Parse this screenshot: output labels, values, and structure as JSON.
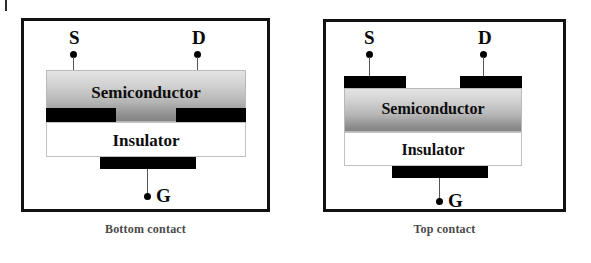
{
  "figure": {
    "page_background": "#ffffff",
    "panels": [
      {
        "id": "bottom-contact",
        "caption": "Bottom contact",
        "layers": [
          {
            "name": "Semiconductor",
            "label": "Semiconductor",
            "fill": "gray-gradient"
          },
          {
            "name": "Insulator",
            "label": "Insulator",
            "fill": "#ffffff"
          }
        ],
        "electrodes": [
          {
            "name": "source",
            "label": "S",
            "position": "bottom-of-semiconductor-left",
            "color": "#000000"
          },
          {
            "name": "drain",
            "label": "D",
            "position": "bottom-of-semiconductor-right",
            "color": "#000000"
          },
          {
            "name": "gate",
            "label": "G",
            "position": "below-insulator",
            "color": "#000000"
          }
        ],
        "border_color": "#121212"
      },
      {
        "id": "top-contact",
        "caption": "Top contact",
        "layers": [
          {
            "name": "Semiconductor",
            "label": "Semiconductor",
            "fill": "gray-gradient"
          },
          {
            "name": "Insulator",
            "label": "Insulator",
            "fill": "#ffffff"
          }
        ],
        "electrodes": [
          {
            "name": "source",
            "label": "S",
            "position": "top-of-semiconductor-left",
            "color": "#000000"
          },
          {
            "name": "drain",
            "label": "D",
            "position": "top-of-semiconductor-right",
            "color": "#000000"
          },
          {
            "name": "gate",
            "label": "G",
            "position": "below-insulator",
            "color": "#000000"
          }
        ],
        "border_color": "#121212"
      }
    ]
  }
}
